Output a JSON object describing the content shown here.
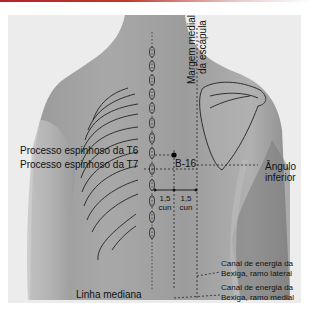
{
  "figure": {
    "labels": {
      "scapula_medial_margin_line1": "Margem medial",
      "scapula_medial_margin_line2": "da escápula",
      "t6": "Processo espinhoso da T6",
      "t7": "Processo espinhoso da T7",
      "point": "B-16",
      "inferior_angle_line1": "Ângulo",
      "inferior_angle_line2": "inferior",
      "cun_left_value": "1,5",
      "cun_left_unit": "cun",
      "cun_right_value": "1,5",
      "cun_right_unit": "cun",
      "lateral_channel_line1": "Canal de energia da",
      "lateral_channel_line2": "Bexiga, ramo lateral",
      "medial_channel_line1": "Canal de energia da",
      "medial_channel_line2": "Bexiga, ramo medial",
      "midline": "Linha mediana"
    },
    "colors": {
      "accent_bar": "#b8202a",
      "skin_dark": "#8a8a8a",
      "skin_light": "#c4c4c4",
      "background": "#ececec",
      "ink": "#111111"
    }
  }
}
